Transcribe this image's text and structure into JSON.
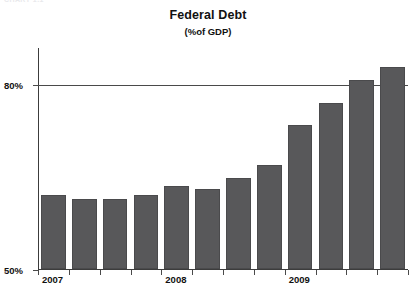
{
  "clipped_header_text": "CHART 1.1",
  "chart_data": {
    "type": "bar",
    "title": "Federal Debt",
    "subtitle": "(%of GDP)",
    "xlabel": "",
    "ylabel": "",
    "ylim": [
      50,
      86
    ],
    "yticks": [
      50,
      80
    ],
    "ytick_labels": [
      "50%",
      "80%"
    ],
    "gridlines": [
      80
    ],
    "grid": true,
    "legend": false,
    "categories": [
      "2007 Q1",
      "2007 Q2",
      "2007 Q3",
      "2007 Q4",
      "2008 Q1",
      "2008 Q2",
      "2008 Q3",
      "2008 Q4",
      "2009 Q1",
      "2009 Q2",
      "2009 Q3",
      "2009 Q4"
    ],
    "x_group_labels": [
      "2007",
      "2008",
      "2009"
    ],
    "values": [
      62,
      61.4,
      61.4,
      62,
      63.4,
      63,
      64.8,
      66.9,
      73.4,
      77,
      80.7,
      82.8
    ],
    "bar_color": "#58585a",
    "bar_edge_color": "#4a4a4c",
    "axis_color": "#3c3c3c",
    "background_color": "#ffffff"
  }
}
